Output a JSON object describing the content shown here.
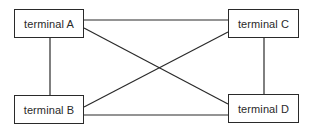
{
  "diagram": {
    "nodes": [
      {
        "id": "A",
        "label": "terminal A",
        "x": 14,
        "y": 9,
        "w": 70,
        "h": 29
      },
      {
        "id": "B",
        "label": "terminal B",
        "x": 14,
        "y": 95,
        "w": 70,
        "h": 29
      },
      {
        "id": "C",
        "label": "terminal C",
        "x": 228,
        "y": 9,
        "w": 71,
        "h": 29
      },
      {
        "id": "D",
        "label": "terminal D",
        "x": 228,
        "y": 94,
        "w": 71,
        "h": 29
      }
    ],
    "edges": [
      {
        "from": "A",
        "to": "C",
        "x1": 84,
        "y1": 20,
        "x2": 228,
        "y2": 20
      },
      {
        "from": "A",
        "to": "B",
        "x1": 50,
        "y1": 38,
        "x2": 50,
        "y2": 95
      },
      {
        "from": "C",
        "to": "D",
        "x1": 264,
        "y1": 38,
        "x2": 264,
        "y2": 94
      },
      {
        "from": "B",
        "to": "D",
        "x1": 84,
        "y1": 115,
        "x2": 228,
        "y2": 115
      },
      {
        "from": "A",
        "to": "D",
        "x1": 84,
        "y1": 28,
        "x2": 228,
        "y2": 104
      },
      {
        "from": "B",
        "to": "C",
        "x1": 84,
        "y1": 107,
        "x2": 228,
        "y2": 32
      }
    ],
    "line_color": "#2a2a2a",
    "text_color": "#2a2a2a",
    "background": "#ffffff"
  }
}
